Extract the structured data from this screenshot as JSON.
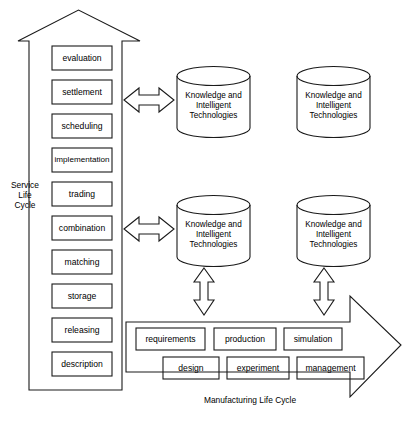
{
  "figure": {
    "background_color": "#ffffff",
    "line_color": "#1a1a1a",
    "type": "block-diagram"
  },
  "service_axis": {
    "label": "Service\nLife\nCycle",
    "direction": "up",
    "stages": [
      {
        "label": "evaluation"
      },
      {
        "label": "settlement"
      },
      {
        "label": "scheduling"
      },
      {
        "label": "implementation"
      },
      {
        "label": "trading"
      },
      {
        "label": "combination"
      },
      {
        "label": "matching"
      },
      {
        "label": "storage"
      },
      {
        "label": "releasing"
      },
      {
        "label": "description"
      }
    ]
  },
  "manufacturing_axis": {
    "label": "Manufacturing Life Cycle",
    "direction": "right",
    "stages_row1": [
      {
        "label": "requirements"
      },
      {
        "label": "production"
      },
      {
        "label": "simulation"
      }
    ],
    "stages_row2": [
      {
        "label": "design"
      },
      {
        "label": "experiment"
      },
      {
        "label": "management"
      }
    ]
  },
  "repositories": [
    {
      "label": "Knowledge and\nIntelligent\nTechnologies",
      "position": "top-left"
    },
    {
      "label": "Knowledge and\nIntelligent\nTechnologies",
      "position": "top-right"
    },
    {
      "label": "Knowledge and\nIntelligent\nTechnologies",
      "position": "bottom-left"
    },
    {
      "label": "Knowledge and\nIntelligent\nTechnologies",
      "position": "bottom-right"
    }
  ],
  "connectors": [
    {
      "name": "service-to-repo-top",
      "orientation": "horizontal",
      "heads": "double"
    },
    {
      "name": "service-to-repo-bottom",
      "orientation": "horizontal",
      "heads": "double"
    },
    {
      "name": "repo-to-manufacturing-left",
      "orientation": "vertical",
      "heads": "double"
    },
    {
      "name": "repo-to-manufacturing-right",
      "orientation": "vertical",
      "heads": "double"
    }
  ]
}
